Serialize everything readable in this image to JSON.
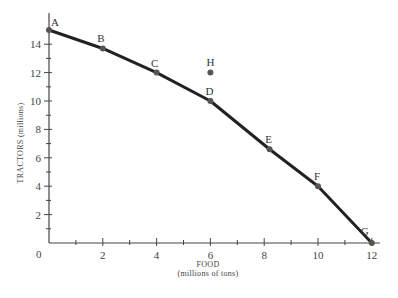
{
  "chart_data": {
    "type": "line",
    "title": "",
    "xlabel": "FOOD",
    "xlabel_sub": "(millions of tons)",
    "ylabel": "TRACTORS (millions)",
    "xlim": [
      0,
      12
    ],
    "ylim": [
      0,
      15
    ],
    "x_ticks": [
      0,
      2,
      4,
      6,
      8,
      10,
      12
    ],
    "y_ticks": [
      2,
      4,
      6,
      8,
      10,
      12,
      14
    ],
    "x_minor_step": 1,
    "y_minor_step": 1,
    "grid": false,
    "legend": null,
    "series": [
      {
        "name": "Production possibilities frontier",
        "points": [
          {
            "label": "A",
            "x": 0,
            "y": 15
          },
          {
            "label": "B",
            "x": 2,
            "y": 13.7
          },
          {
            "label": "C",
            "x": 4,
            "y": 12
          },
          {
            "label": "D",
            "x": 6,
            "y": 10
          },
          {
            "label": "E",
            "x": 8.2,
            "y": 6.6
          },
          {
            "label": "F",
            "x": 10,
            "y": 4
          },
          {
            "label": "G",
            "x": 12,
            "y": 0
          }
        ]
      }
    ],
    "annotations": [
      {
        "label": "H",
        "x": 6,
        "y": 12,
        "type": "point-off-curve"
      }
    ],
    "origin_label": "0"
  },
  "colors": {
    "line": "#222222",
    "point": "#555555",
    "axis": "#444444"
  }
}
